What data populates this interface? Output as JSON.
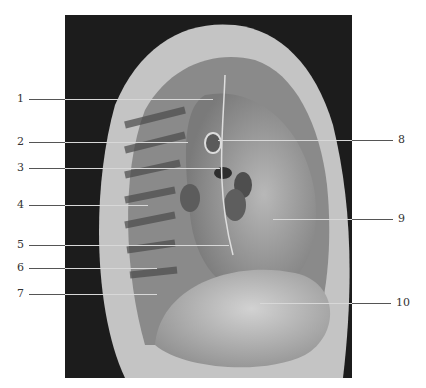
{
  "figure": {
    "type": "anatomical-photograph",
    "labels": [
      {
        "num": "1",
        "side": "left",
        "y": 99
      },
      {
        "num": "2",
        "side": "left",
        "y": 142
      },
      {
        "num": "3",
        "side": "left",
        "y": 168
      },
      {
        "num": "4",
        "side": "left",
        "y": 205
      },
      {
        "num": "5",
        "side": "left",
        "y": 245
      },
      {
        "num": "6",
        "side": "left",
        "y": 268
      },
      {
        "num": "7",
        "side": "left",
        "y": 294
      },
      {
        "num": "8",
        "side": "right",
        "y": 140
      },
      {
        "num": "9",
        "side": "right",
        "y": 219
      },
      {
        "num": "10",
        "side": "right",
        "y": 303
      }
    ]
  }
}
